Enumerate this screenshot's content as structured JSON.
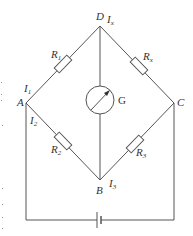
{
  "diagram": {
    "type": "circuit",
    "nodes": {
      "A": {
        "label": "A"
      },
      "B": {
        "label": "B"
      },
      "C": {
        "label": "C"
      },
      "D": {
        "label": "D"
      }
    },
    "resistors": [
      {
        "id": "R1",
        "label": "R",
        "sub": "1",
        "between": [
          "A",
          "D"
        ]
      },
      {
        "id": "Rx",
        "label": "R",
        "sub": "x",
        "between": [
          "D",
          "C"
        ]
      },
      {
        "id": "R2",
        "label": "R",
        "sub": "2",
        "between": [
          "A",
          "B"
        ]
      },
      {
        "id": "R3",
        "label": "R",
        "sub": "3",
        "between": [
          "B",
          "C"
        ]
      }
    ],
    "currents": [
      {
        "id": "I1",
        "label": "I",
        "sub": "1",
        "near": "A"
      },
      {
        "id": "I2",
        "label": "I",
        "sub": "2",
        "near": "A"
      },
      {
        "id": "I3",
        "label": "I",
        "sub": "3",
        "near": "B"
      },
      {
        "id": "Ix",
        "label": "I",
        "sub": "x",
        "near": "D"
      }
    ],
    "galvanometer": {
      "label": "G",
      "between": [
        "D",
        "B"
      ]
    },
    "battery": {
      "between": [
        "A",
        "C"
      ],
      "position": "bottom"
    }
  }
}
